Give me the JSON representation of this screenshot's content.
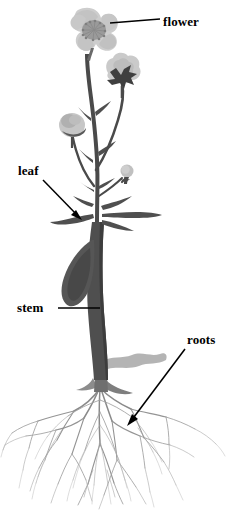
{
  "diagram": {
    "background_color": "#ffffff",
    "ink_color": "#000000"
  },
  "labels": [
    {
      "id": "flower",
      "text": "flower",
      "leader": "straight-line",
      "points_to": "top bloom"
    },
    {
      "id": "leaf",
      "text": "leaf",
      "leader": "arrow",
      "points_to": "lance-shaped leaf on left"
    },
    {
      "id": "stem",
      "text": "stem",
      "leader": "straight-line",
      "points_to": "thick main stalk"
    },
    {
      "id": "roots",
      "text": "roots",
      "leader": "arrow",
      "points_to": "fibrous root mass"
    }
  ],
  "colors": {
    "flower_light": "#cfcfcf",
    "flower_mid": "#b4b4b4",
    "flower_dark": "#9a9a9a",
    "stem_dark": "#4a4a4a",
    "stem_mid": "#6a6a6a",
    "leaf_dark": "#545454",
    "root_gray": "#9b9b9b",
    "withered_leaf": "#b0b0b0"
  }
}
